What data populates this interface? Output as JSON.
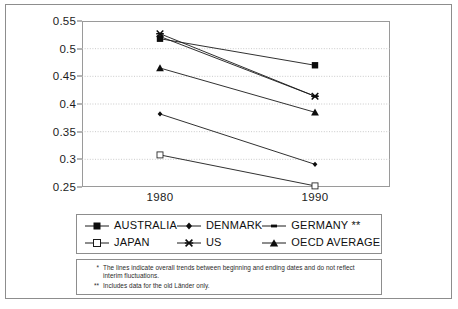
{
  "chart_data": {
    "type": "line",
    "title": "",
    "subtitle": "",
    "xlabel": "",
    "ylabel": "",
    "x": [
      "1980",
      "1990"
    ],
    "categories": [
      "1980",
      "1990"
    ],
    "ylim": [
      0.25,
      0.55
    ],
    "ytick_step": 0.05,
    "yticks": [
      "0.55",
      "0.5",
      "0.45",
      "0.4",
      "0.35",
      "0.3",
      "0.25"
    ],
    "ytick_values": [
      0.55,
      0.5,
      0.45,
      0.4,
      0.35,
      0.3,
      0.25
    ],
    "grid": "horizontal-dotted",
    "legend_position": "below-plot",
    "series": [
      {
        "name": "AUSTRALIA",
        "marker": "filled-square",
        "values": [
          0.518,
          0.47
        ]
      },
      {
        "name": "DENMARK",
        "marker": "small-diamond",
        "values": [
          0.382,
          0.291
        ]
      },
      {
        "name": "GERMANY **",
        "marker": "small-dash",
        "values": [
          0.522,
          0.414
        ]
      },
      {
        "name": "JAPAN",
        "marker": "open-square",
        "values": [
          0.308,
          0.252
        ]
      },
      {
        "name": "US",
        "marker": "cross-x",
        "values": [
          0.527,
          0.414
        ]
      },
      {
        "name": "OECD AVERAGE",
        "marker": "filled-triangle",
        "values": [
          0.465,
          0.385
        ]
      }
    ]
  },
  "axis": {
    "y_labels": [
      "0.55",
      "0.5",
      "0.45",
      "0.4",
      "0.35",
      "0.3",
      "0.25"
    ],
    "x_labels": [
      "1980",
      "1990"
    ]
  },
  "legend": {
    "items": [
      {
        "label": "AUSTRALIA",
        "marker": "filled-square"
      },
      {
        "label": "DENMARK",
        "marker": "small-diamond"
      },
      {
        "label": "GERMANY **",
        "marker": "small-dash"
      },
      {
        "label": "JAPAN",
        "marker": "open-square"
      },
      {
        "label": "US",
        "marker": "cross-x"
      },
      {
        "label": "OECD AVERAGE",
        "marker": "filled-triangle"
      }
    ]
  },
  "footnotes": [
    {
      "mark": "*",
      "text": "The lines indicate overall trends between beginning and ending dates and do not reflect",
      "continuation": "interim fluctuations."
    },
    {
      "mark": "**",
      "text": "Includes data for the old Länder only.",
      "continuation": ""
    }
  ],
  "colors": {
    "line": "#1a1a1a",
    "marker": "#0d0d0d",
    "grid": "#bdbdbd",
    "frame": "#8d8d8d",
    "text": "#1c1c1c"
  }
}
